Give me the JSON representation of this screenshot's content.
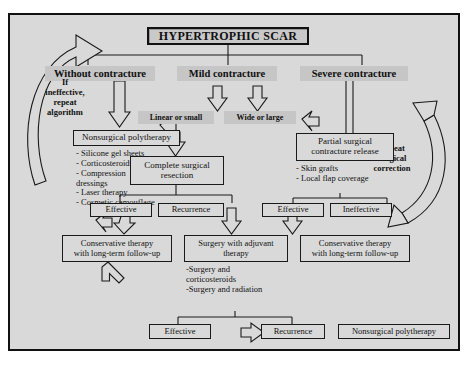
{
  "diagram": {
    "title": "HYPERTROPHIC SCAR",
    "categories": [
      {
        "id": "without",
        "label": "Without contracture"
      },
      {
        "id": "mild",
        "label": "Mild contracture"
      },
      {
        "id": "severe",
        "label": "Severe contracture"
      }
    ],
    "subtypes": [
      {
        "id": "linear",
        "label": "Linear or small"
      },
      {
        "id": "wide",
        "label": "Wide or large"
      }
    ],
    "loop_left": "If\nineffective,\nrepeat\nalgorithm",
    "loop_right": "Repeat\nsurgical\ncorrection",
    "nonsurgical": {
      "label": "Nonsurgical polytherapy",
      "items": "- Silicone gel sheets\n- Corticosteroids\n- Compression\ndressings\n- Laser therapy\n- Cosmetic camouflage"
    },
    "complete_resection": {
      "label": "Complete surgical\nresection"
    },
    "partial_release": {
      "label": "Partial surgical\ncontracture release",
      "items": "- Skin grafts\n- Local flap coverage"
    },
    "outcomes": [
      {
        "id": "eff1",
        "label": "Effective"
      },
      {
        "id": "rec1",
        "label": "Recurrence"
      },
      {
        "id": "eff2",
        "label": "Effective"
      },
      {
        "id": "ineff2",
        "label": "Ineffective"
      }
    ],
    "conservative_left": {
      "label": "Conservative therapy\nwith long-term follow-up"
    },
    "adjuvant": {
      "label": "Surgery with adjuvant\ntherapy",
      "items": "-Surgery and\ncorticosteroids\n-Surgery and radiation"
    },
    "conservative_right": {
      "label": "Conservative therapy\nwith long-term follow-up"
    },
    "bottom": [
      {
        "id": "eff3",
        "label": "Effective"
      },
      {
        "id": "rec3",
        "label": "Recurrence"
      },
      {
        "id": "nonsurg2",
        "label": "Nonsurgical polytherapy"
      }
    ],
    "colors": {
      "background": "#d9d9d9",
      "shade": "#c6c6c6",
      "stroke": "#1a1a1a",
      "page": "#ffffff"
    }
  }
}
